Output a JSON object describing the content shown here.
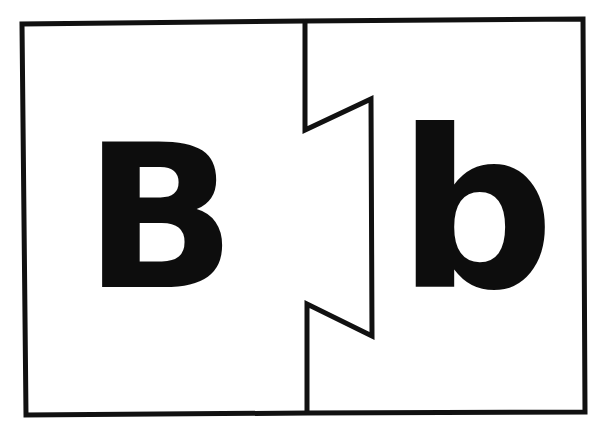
{
  "puzzle": {
    "description": "Two-piece letter matching puzzle card",
    "left_piece": {
      "letter": "B",
      "case": "uppercase"
    },
    "right_piece": {
      "letter": "b",
      "case": "lowercase"
    },
    "colors": {
      "ink": "#111111",
      "background": "#ffffff"
    }
  }
}
